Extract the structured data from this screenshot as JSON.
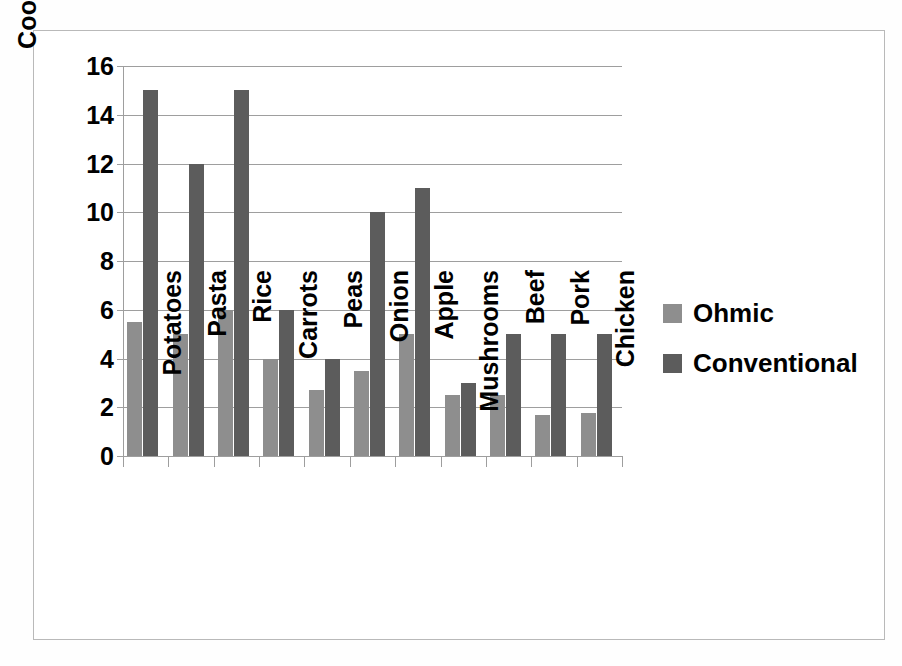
{
  "chart_data": {
    "type": "bar",
    "title": "",
    "xlabel": "",
    "ylabel": "Cooking time (min)",
    "ylim": [
      0,
      16
    ],
    "ytick_step": 2,
    "yticks": [
      "16",
      "14",
      "12",
      "10",
      "8",
      "6",
      "4",
      "2",
      "0"
    ],
    "grid": true,
    "legend_position": "right",
    "categories": [
      "Potatoes",
      "Pasta",
      "Rice",
      "Carrots",
      "Peas",
      "Onion",
      "Apple",
      "Mushrooms",
      "Beef",
      "Pork",
      "Chicken"
    ],
    "series": [
      {
        "name": "Ohmic",
        "color": "#8e8e8e",
        "values": [
          5.5,
          5.0,
          6.0,
          4.0,
          2.7,
          3.5,
          5.0,
          2.5,
          2.5,
          1.7,
          1.75
        ]
      },
      {
        "name": "Conventional",
        "color": "#5c5c5c",
        "values": [
          15,
          12,
          15,
          6,
          4,
          10,
          11,
          3,
          5,
          5,
          5
        ]
      }
    ]
  },
  "legend": {
    "items": [
      {
        "label": "Ohmic",
        "color": "#8e8e8e"
      },
      {
        "label": "Conventional",
        "color": "#5c5c5c"
      }
    ]
  },
  "axes": {
    "y_title": "Cooking time (min)"
  },
  "colors": {
    "ohmic": "#8e8e8e",
    "conventional": "#5c5c5c",
    "gridline": "#9e9e9e",
    "frame": "#b9b9b9",
    "background": "#ffffff",
    "text": "#000000"
  }
}
